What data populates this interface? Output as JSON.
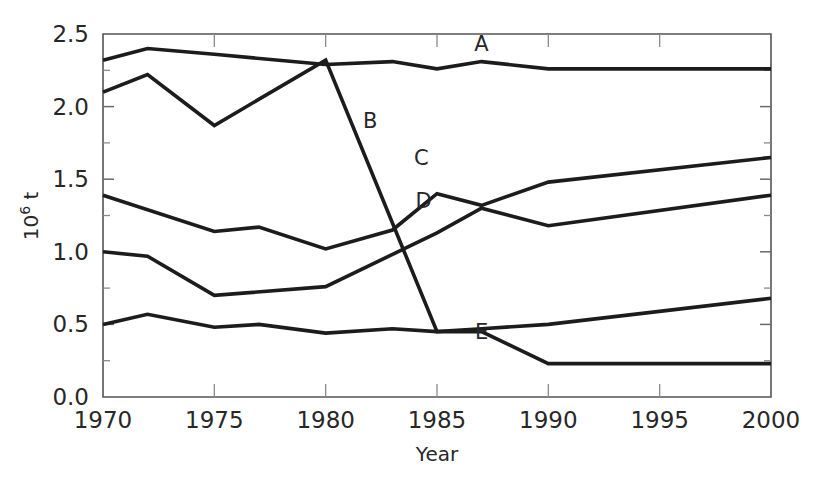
{
  "chart_data": {
    "type": "line",
    "title": "",
    "xlabel": "Year",
    "ylabel": "10⁶ t",
    "ylabel_base": "10",
    "ylabel_exp": "6",
    "ylabel_unit": " t",
    "xlim": [
      1970,
      2000
    ],
    "ylim": [
      0.0,
      2.5
    ],
    "grid": false,
    "legend_position": "inline-labels",
    "x_ticks": [
      1970,
      1975,
      1980,
      1985,
      1990,
      1995,
      2000
    ],
    "x_tick_labels": [
      "1970",
      "1975",
      "1980",
      "1985",
      "1990",
      "1995",
      "2000"
    ],
    "y_ticks": [
      0.0,
      0.5,
      1.0,
      1.5,
      2.0,
      2.5
    ],
    "y_tick_labels": [
      "0.0",
      "0.5",
      "1.0",
      "1.5",
      "2.0",
      "2.5"
    ],
    "y_minor_ticks": [
      0.25,
      0.75,
      1.25,
      1.75,
      2.25
    ],
    "line_color": "#1c1c1c",
    "axis_color": "#545454",
    "series": [
      {
        "name": "A",
        "label": "A",
        "label_x": 1987.0,
        "label_y": 2.38,
        "x": [
          1970,
          1972,
          1975,
          1980,
          1983,
          1985,
          1987,
          1990,
          1995,
          2000
        ],
        "values": [
          2.32,
          2.4,
          2.36,
          2.29,
          2.31,
          2.26,
          2.31,
          2.26,
          2.26,
          2.26
        ]
      },
      {
        "name": "B",
        "label": "B",
        "label_x": 1982.0,
        "label_y": 1.85,
        "x": [
          1970,
          1972,
          1975,
          1980,
          1985,
          1987,
          1990,
          2000
        ],
        "values": [
          2.1,
          2.22,
          1.87,
          2.32,
          0.45,
          0.47,
          0.5,
          0.68
        ]
      },
      {
        "name": "C",
        "label": "C",
        "label_x": 1984.3,
        "label_y": 1.6,
        "x": [
          1970,
          1975,
          1977,
          1980,
          1983,
          1985,
          1987,
          1990,
          2000
        ],
        "values": [
          1.39,
          1.14,
          1.17,
          1.02,
          1.15,
          1.4,
          1.32,
          1.48,
          1.65
        ]
      },
      {
        "name": "D",
        "label": "D",
        "label_x": 1984.4,
        "label_y": 1.3,
        "x": [
          1970,
          1972,
          1975,
          1980,
          1985,
          1987,
          1990,
          2000
        ],
        "values": [
          1.0,
          0.97,
          0.7,
          0.76,
          1.13,
          1.3,
          1.18,
          1.39
        ]
      },
      {
        "name": "E",
        "label": "E",
        "label_x": 1987.0,
        "label_y": 0.4,
        "x": [
          1970,
          1972,
          1975,
          1977,
          1980,
          1983,
          1985,
          1987,
          1990,
          1995,
          2000
        ],
        "values": [
          0.5,
          0.57,
          0.48,
          0.5,
          0.44,
          0.47,
          0.45,
          0.45,
          0.23,
          0.23,
          0.23
        ]
      }
    ]
  }
}
